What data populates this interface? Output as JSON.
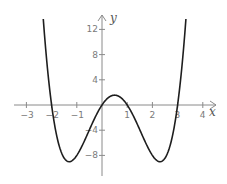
{
  "chart_data": {
    "type": "line",
    "title": "",
    "xlabel": "x",
    "ylabel": "y",
    "function": "y = x(x + 2)(x - 1)(x - 3)",
    "x_ticks": [
      -3,
      -2,
      -1,
      1,
      2,
      3,
      4
    ],
    "x_tick_labels": [
      "−3",
      "−2",
      "−1",
      "1",
      "2",
      "3",
      "4"
    ],
    "y_ticks": [
      12,
      8,
      4,
      -4,
      -8
    ],
    "y_tick_labels": [
      "12",
      "8",
      "4",
      "−4",
      "−8"
    ],
    "xlim": [
      -3.5,
      4.4
    ],
    "ylim": [
      -11,
      13.5
    ],
    "grid": false,
    "legend": null,
    "series": [
      {
        "name": "f(x)",
        "x": [
          -2.33,
          -2.2,
          -2.0,
          -1.8,
          -1.6,
          -1.4,
          -1.3,
          -1.2,
          -1.0,
          -0.8,
          -0.6,
          -0.4,
          -0.2,
          0.0,
          0.2,
          0.4,
          0.5,
          0.6,
          0.8,
          1.0,
          1.2,
          1.4,
          1.6,
          1.8,
          2.0,
          2.2,
          2.3,
          2.4,
          2.6,
          2.8,
          3.0,
          3.2,
          3.33
        ],
        "y": [
          12.3,
          7.7,
          0.0,
          -5.3,
          -8.2,
          -9.0,
          -9.0,
          -8.5,
          -8.0,
          -6.3,
          -4.3,
          -2.2,
          -0.5,
          0.0,
          0.9,
          1.5,
          1.6,
          1.5,
          0.9,
          0.0,
          -1.3,
          -3.1,
          -5.1,
          -7.0,
          -8.0,
          -9.0,
          -9.0,
          -8.6,
          -7.1,
          -4.5,
          0.0,
          6.6,
          12.3
        ]
      }
    ],
    "roots": [
      -2,
      0,
      1,
      3
    ],
    "colors": {
      "curve": "#1e1e1e",
      "axes": "#8a8a8a",
      "labels": "#7a7a7a"
    }
  }
}
